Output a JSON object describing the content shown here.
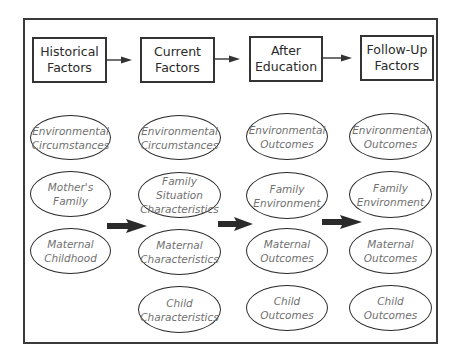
{
  "headers": [
    {
      "label": "Historical\nFactors"
    },
    {
      "label": "Current\nFactors"
    },
    {
      "label": "After\nEducation"
    },
    {
      "label": "Follow-Up\nFactors"
    }
  ],
  "columns": [
    {
      "items": [
        "Environmental\nCircumstances",
        "Mother's\nFamily",
        "Maternal\nChildhood"
      ]
    },
    {
      "items": [
        "Environmental\nCircumstances",
        "Family Situation\nCharacteristics",
        "Maternal\nCharacteristics",
        "Child\nCharacteristics"
      ]
    },
    {
      "items": [
        "Environmental\nOutcomes",
        "Family\nEnvironment",
        "Maternal\nOutcomes",
        "Child\nOutcomes"
      ]
    },
    {
      "items": [
        "Environmental\nOutcomes",
        "Family\nEnvironment",
        "Maternal\nOutcomes",
        "Child\nOutcomes"
      ]
    }
  ],
  "colors": {
    "stroke": "#333333",
    "oval_text": "#707070",
    "header_text": "#2a2a2a"
  }
}
